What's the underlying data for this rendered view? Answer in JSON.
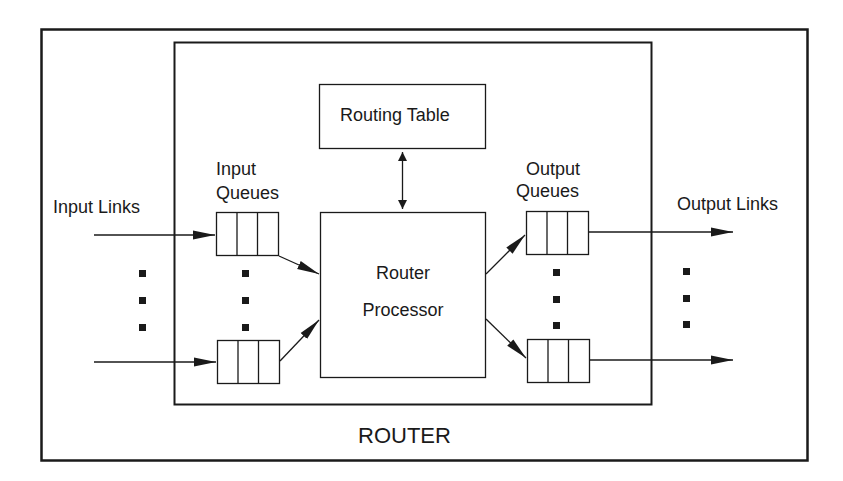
{
  "diagram": {
    "router_label": "ROUTER",
    "routing_table_label": "Routing Table",
    "processor_label_line1": "Router",
    "processor_label_line2": "Processor",
    "input_queues_line1": "Input",
    "input_queues_line2": "Queues",
    "output_queues_line1": "Output",
    "output_queues_line2": "Queues",
    "input_links_label": "Input Links",
    "output_links_label": "Output Links",
    "colors": {
      "stroke": "#1a1a1a",
      "background": "#ffffff"
    }
  }
}
